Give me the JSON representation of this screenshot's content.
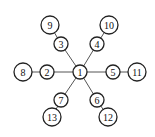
{
  "diagram": {
    "type": "tree-graph",
    "nodes": [
      {
        "id": "1",
        "label": "1",
        "level": 0
      },
      {
        "id": "2",
        "label": "2",
        "level": 1
      },
      {
        "id": "3",
        "label": "3",
        "level": 1
      },
      {
        "id": "4",
        "label": "4",
        "level": 1
      },
      {
        "id": "5",
        "label": "5",
        "level": 1
      },
      {
        "id": "6",
        "label": "6",
        "level": 1
      },
      {
        "id": "7",
        "label": "7",
        "level": 1
      },
      {
        "id": "8",
        "label": "8",
        "level": 2
      },
      {
        "id": "9",
        "label": "9",
        "level": 2
      },
      {
        "id": "10",
        "label": "10",
        "level": 2
      },
      {
        "id": "11",
        "label": "11",
        "level": 2
      },
      {
        "id": "12",
        "label": "12",
        "level": 2
      },
      {
        "id": "13",
        "label": "13",
        "level": 2
      }
    ],
    "edges": [
      [
        "1",
        "2"
      ],
      [
        "1",
        "3"
      ],
      [
        "1",
        "4"
      ],
      [
        "1",
        "5"
      ],
      [
        "1",
        "6"
      ],
      [
        "1",
        "7"
      ],
      [
        "2",
        "8"
      ],
      [
        "3",
        "9"
      ],
      [
        "4",
        "10"
      ],
      [
        "5",
        "11"
      ],
      [
        "6",
        "12"
      ],
      [
        "7",
        "13"
      ]
    ]
  }
}
